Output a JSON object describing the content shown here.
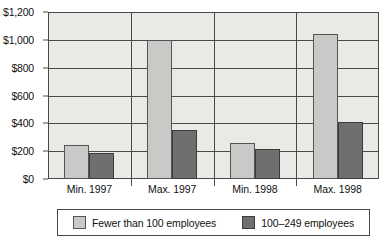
{
  "chart_data": {
    "type": "bar",
    "title": "",
    "subtitle": "",
    "xlabel": "",
    "ylabel": "",
    "categories": [
      "Min. 1997",
      "Max. 1997",
      "Min. 1998",
      "Max. 1998"
    ],
    "series": [
      {
        "name": "Fewer than 100 employees",
        "color": "#c9c9c7",
        "values": [
          245,
          1000,
          260,
          1040
        ]
      },
      {
        "name": "100–249 employees",
        "color": "#6f6f6f",
        "values": [
          185,
          350,
          215,
          410
        ]
      }
    ],
    "ylim": [
      0,
      1200
    ],
    "ytick_values": [
      0,
      200,
      400,
      600,
      800,
      1000,
      1200
    ],
    "ytick_labels": [
      "$0",
      "$200",
      "$400",
      "$600",
      "$800",
      "$1,000",
      "$1,200"
    ],
    "grid": true,
    "legend_position": "bottom",
    "annotations": []
  },
  "legend": {
    "entries": [
      {
        "label": "Fewer than 100 employees",
        "color": "#c9c9c7"
      },
      {
        "label": "100–249 employees",
        "color": "#6f6f6f"
      }
    ]
  },
  "colors": {
    "plot_background": "#e9e9e6",
    "axis": "#4a4a4a",
    "text": "#111111",
    "series_light": "#c9c9c7",
    "series_dark": "#6f6f6f"
  }
}
